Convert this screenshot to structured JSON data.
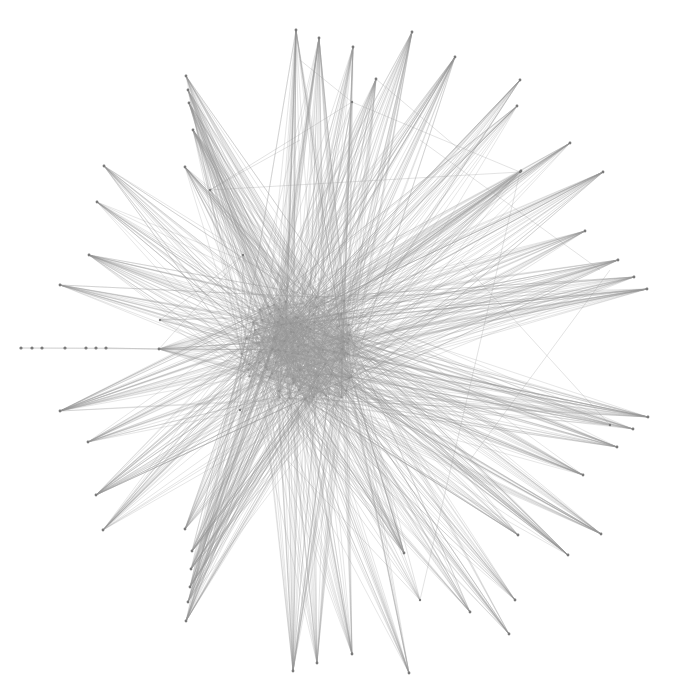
{
  "graph": {
    "type": "force-directed-network",
    "width": 673,
    "height": 693,
    "colors": {
      "background": "#ffffff",
      "edge": "#9a9a9a",
      "node": "#7a7a7a"
    },
    "hub": {
      "cx": 300,
      "cy": 350,
      "rx": 60,
      "ry": 55,
      "seed_count": 70
    },
    "outer_nodes": [
      {
        "x": 296,
        "y": 30
      },
      {
        "x": 319,
        "y": 38
      },
      {
        "x": 353,
        "y": 47
      },
      {
        "x": 412,
        "y": 32
      },
      {
        "x": 455,
        "y": 57
      },
      {
        "x": 376,
        "y": 79
      },
      {
        "x": 520,
        "y": 80
      },
      {
        "x": 517,
        "y": 106
      },
      {
        "x": 570,
        "y": 143
      },
      {
        "x": 603,
        "y": 172
      },
      {
        "x": 521,
        "y": 171
      },
      {
        "x": 585,
        "y": 231
      },
      {
        "x": 618,
        "y": 260
      },
      {
        "x": 634,
        "y": 277
      },
      {
        "x": 647,
        "y": 289
      },
      {
        "x": 648,
        "y": 417
      },
      {
        "x": 633,
        "y": 429
      },
      {
        "x": 617,
        "y": 447
      },
      {
        "x": 583,
        "y": 475
      },
      {
        "x": 601,
        "y": 534
      },
      {
        "x": 568,
        "y": 555
      },
      {
        "x": 518,
        "y": 535
      },
      {
        "x": 515,
        "y": 600
      },
      {
        "x": 509,
        "y": 634
      },
      {
        "x": 470,
        "y": 612
      },
      {
        "x": 409,
        "y": 673
      },
      {
        "x": 352,
        "y": 654
      },
      {
        "x": 317,
        "y": 663
      },
      {
        "x": 293,
        "y": 671
      },
      {
        "x": 404,
        "y": 553
      },
      {
        "x": 186,
        "y": 621
      },
      {
        "x": 188,
        "y": 602
      },
      {
        "x": 190,
        "y": 587
      },
      {
        "x": 191,
        "y": 569
      },
      {
        "x": 192,
        "y": 551
      },
      {
        "x": 103,
        "y": 530
      },
      {
        "x": 96,
        "y": 495
      },
      {
        "x": 88,
        "y": 442
      },
      {
        "x": 60,
        "y": 411
      },
      {
        "x": 185,
        "y": 529
      },
      {
        "x": 60,
        "y": 285
      },
      {
        "x": 89,
        "y": 255
      },
      {
        "x": 97,
        "y": 202
      },
      {
        "x": 104,
        "y": 166
      },
      {
        "x": 186,
        "y": 76
      },
      {
        "x": 188,
        "y": 90
      },
      {
        "x": 189,
        "y": 103
      },
      {
        "x": 193,
        "y": 130
      },
      {
        "x": 185,
        "y": 167
      },
      {
        "x": 159,
        "y": 349
      }
    ],
    "chain_nodes": [
      {
        "x": 21,
        "y": 348
      },
      {
        "x": 32,
        "y": 348
      },
      {
        "x": 42,
        "y": 348
      },
      {
        "x": 65,
        "y": 348
      },
      {
        "x": 86,
        "y": 348
      },
      {
        "x": 96,
        "y": 348
      },
      {
        "x": 106,
        "y": 348
      }
    ],
    "frame_nodes": [
      {
        "x": 352,
        "y": 102
      },
      {
        "x": 520,
        "y": 172
      },
      {
        "x": 210,
        "y": 190
      },
      {
        "x": 243,
        "y": 255
      },
      {
        "x": 240,
        "y": 410
      },
      {
        "x": 420,
        "y": 600
      },
      {
        "x": 610,
        "y": 425
      },
      {
        "x": 160,
        "y": 320
      }
    ],
    "long_edges": [
      [
        352,
        102,
        520,
        172
      ],
      [
        352,
        102,
        210,
        190
      ],
      [
        210,
        190,
        520,
        172
      ],
      [
        243,
        255,
        240,
        410
      ],
      [
        160,
        320,
        243,
        255
      ],
      [
        520,
        172,
        420,
        600
      ],
      [
        610,
        425,
        460,
        260
      ],
      [
        610,
        270,
        470,
        460
      ],
      [
        159,
        349,
        243,
        255
      ],
      [
        159,
        349,
        106,
        348
      ],
      [
        21,
        348,
        159,
        349
      ],
      [
        240,
        410,
        420,
        600
      ],
      [
        352,
        102,
        300,
        60
      ],
      [
        376,
        79,
        460,
        150
      ],
      [
        210,
        190,
        300,
        140
      ],
      [
        420,
        140,
        600,
        270
      ]
    ]
  }
}
